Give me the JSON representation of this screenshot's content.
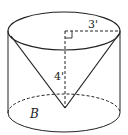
{
  "diagram": {
    "type": "cone inscribed in cylinder",
    "labels": {
      "radius": "3'",
      "height": "4'",
      "base": "B"
    },
    "colors": {
      "stroke": "#222222",
      "background": "#ffffff"
    }
  }
}
